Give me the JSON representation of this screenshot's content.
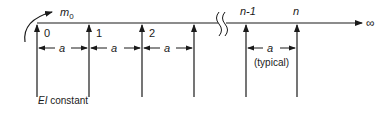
{
  "diagram": {
    "moment_label": "m",
    "moment_subscript": "0",
    "infinity_symbol": "∞",
    "support_labels": [
      "0",
      "1",
      "2",
      "",
      "n-1",
      "n"
    ],
    "span_label": "a",
    "typical_label": "(typical)",
    "stiffness_label_italic": "EI",
    "stiffness_label_rest": " constant",
    "colors": {
      "line": "#1a1a1a",
      "background": "#ffffff"
    }
  }
}
